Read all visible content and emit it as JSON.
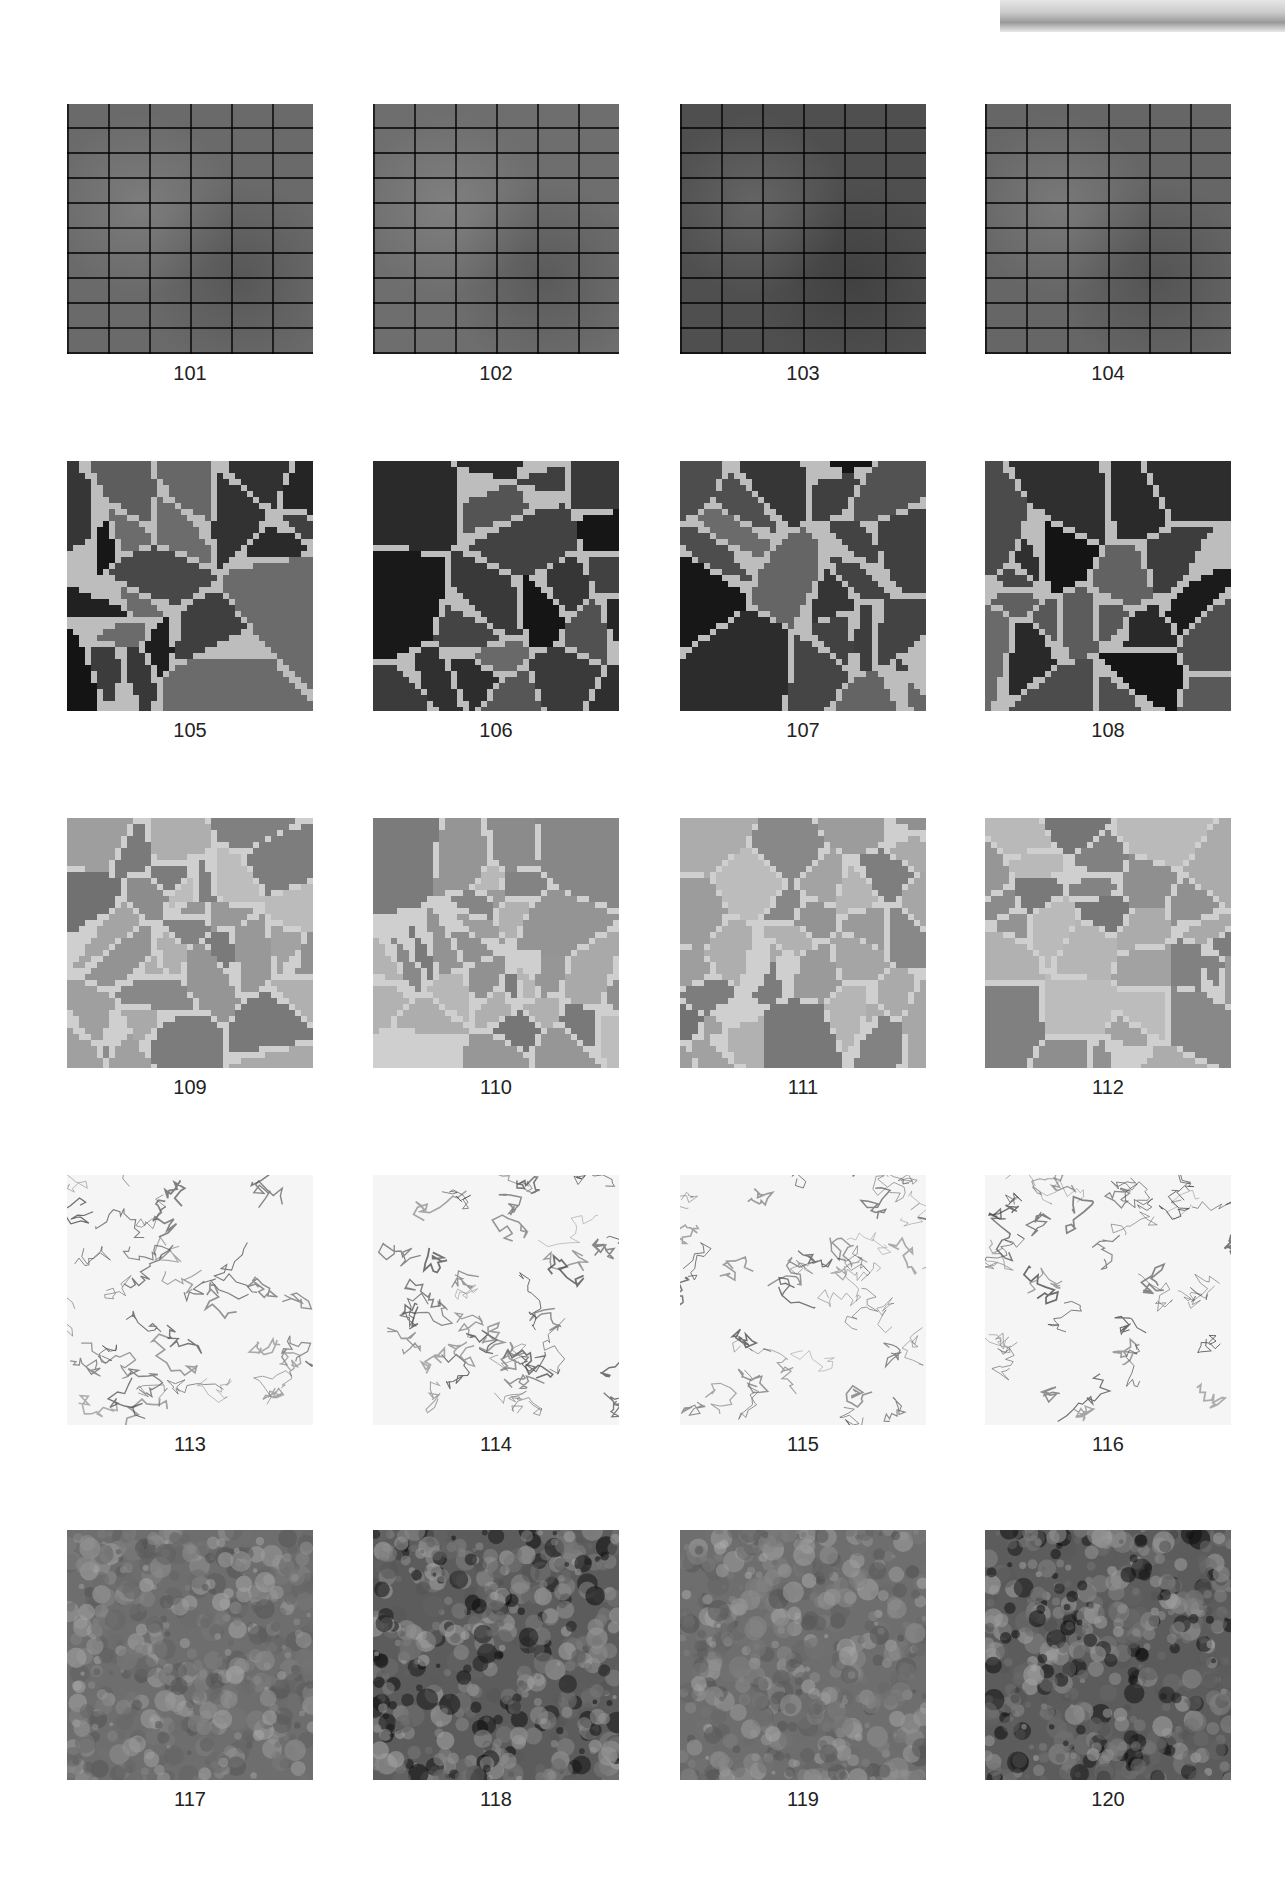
{
  "header": {
    "decoration": "gray-gradient-bar"
  },
  "grid": {
    "rows": [
      {
        "style": "herringbone-brick",
        "items": [
          {
            "number": "101",
            "tone": "#6a6a6a"
          },
          {
            "number": "102",
            "tone": "#6e6e6e"
          },
          {
            "number": "103",
            "tone": "#4f4f4f"
          },
          {
            "number": "104",
            "tone": "#666666"
          }
        ]
      },
      {
        "style": "voronoi-stone-dark",
        "items": [
          {
            "number": "105",
            "tone": "#2a2a2a"
          },
          {
            "number": "106",
            "tone": "#333333"
          },
          {
            "number": "107",
            "tone": "#252525"
          },
          {
            "number": "108",
            "tone": "#3c3c3c"
          }
        ]
      },
      {
        "style": "voronoi-stone-light",
        "items": [
          {
            "number": "109",
            "tone": "#8c8c8c"
          },
          {
            "number": "110",
            "tone": "#999999"
          },
          {
            "number": "111",
            "tone": "#8a8a8a"
          },
          {
            "number": "112",
            "tone": "#9a9a9a"
          }
        ]
      },
      {
        "style": "white-marble",
        "items": [
          {
            "number": "113",
            "tone": "#f4f4f4"
          },
          {
            "number": "114",
            "tone": "#f0f0f0"
          },
          {
            "number": "115",
            "tone": "#f2f2f2"
          },
          {
            "number": "116",
            "tone": "#f3f3f3"
          }
        ]
      },
      {
        "style": "granite",
        "items": [
          {
            "number": "117",
            "tone": "#6b6b6b"
          },
          {
            "number": "118",
            "tone": "#5a5a5a"
          },
          {
            "number": "119",
            "tone": "#707070"
          },
          {
            "number": "120",
            "tone": "#595959"
          }
        ]
      }
    ]
  }
}
